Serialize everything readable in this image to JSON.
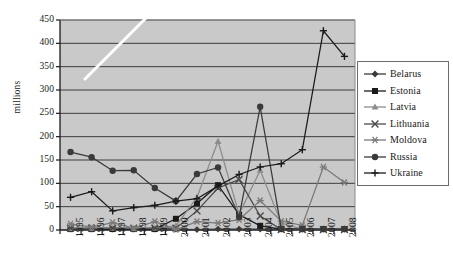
{
  "chart_data": {
    "type": "line",
    "title": "",
    "xlabel": "",
    "ylabel": "millions",
    "categories": [
      "1995",
      "1996",
      "1997",
      "1998",
      "1999",
      "2000",
      "2001",
      "2002",
      "2003",
      "2004",
      "2005",
      "2006",
      "2007",
      "2008"
    ],
    "ylim": [
      0,
      450
    ],
    "yticks": [
      "0",
      "50",
      "100",
      "150",
      "200",
      "250",
      "300",
      "350",
      "400",
      "450"
    ],
    "grid": true,
    "legend_position": "right",
    "plot_background": "#c9c9c9",
    "series": [
      {
        "name": "Belarus",
        "marker": "diamond",
        "color": "#3a3a3a",
        "values": [
          2,
          2,
          2,
          2,
          2,
          2,
          1,
          2,
          2,
          2,
          2,
          2,
          2,
          2
        ]
      },
      {
        "name": "Estonia",
        "marker": "square",
        "color": "#1a1a1a",
        "values": [
          2,
          2,
          2,
          2,
          2,
          24,
          57,
          96,
          33,
          9,
          2,
          2,
          2,
          2
        ]
      },
      {
        "name": "Latvia",
        "marker": "triangle",
        "color": "#8c8c8c",
        "values": [
          3,
          3,
          4,
          3,
          4,
          9,
          70,
          190,
          34,
          128,
          15,
          2,
          2,
          2
        ]
      },
      {
        "name": "Lithuania",
        "marker": "x",
        "color": "#4a4a4a",
        "values": [
          4,
          4,
          4,
          4,
          4,
          4,
          41,
          90,
          108,
          30,
          1,
          1,
          1,
          1
        ]
      },
      {
        "name": "Moldova",
        "marker": "asterisk",
        "color": "#7a7a7a",
        "values": [
          13,
          6,
          16,
          4,
          18,
          1,
          18,
          15,
          22,
          63,
          19,
          10,
          135,
          102
        ]
      },
      {
        "name": "Russia",
        "marker": "circle",
        "color": "#3a3a3a",
        "values": [
          167,
          156,
          127,
          128,
          90,
          62,
          120,
          134,
          28,
          264,
          3,
          2,
          2,
          2
        ]
      },
      {
        "name": "Ukraine",
        "marker": "plus",
        "color": "#1a1a1a",
        "values": [
          70,
          82,
          41,
          48,
          53,
          62,
          67,
          94,
          119,
          135,
          142,
          172,
          427,
          372
        ]
      }
    ]
  },
  "legend": {
    "items": [
      {
        "label": "Belarus"
      },
      {
        "label": "Estonia"
      },
      {
        "label": "Latvia"
      },
      {
        "label": "Lithuania"
      },
      {
        "label": "Moldova"
      },
      {
        "label": "Russia"
      },
      {
        "label": "Ukraine"
      }
    ]
  }
}
